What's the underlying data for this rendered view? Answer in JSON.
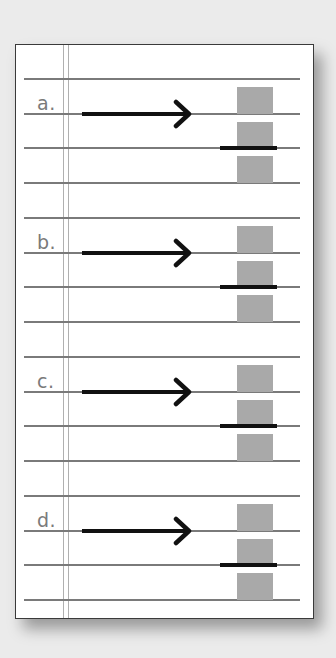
{
  "diagram": {
    "colors": {
      "background": "#ebebeb",
      "card": "#ffffff",
      "card_border": "#3a3a3a",
      "rule_line": "#7a7a7a",
      "margin_line": "#b0b0b0",
      "label": "#7a7a7a",
      "arrow": "#111111",
      "block": "#a9a9a9",
      "bar": "#111111"
    },
    "sections": [
      {
        "label": "a.",
        "top": 79
      },
      {
        "label": "b.",
        "top": 218
      },
      {
        "label": "c.",
        "top": 357
      },
      {
        "label": "d.",
        "top": 496
      }
    ],
    "line_spacing": 34.6,
    "lines_per_section": 4,
    "arrow_icon": "right-arrow",
    "block_count": 3
  }
}
